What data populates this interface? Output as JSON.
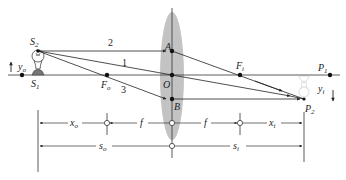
{
  "diagram": {
    "type": "thin-lens-ray-diagram",
    "object": {
      "top_label": "S",
      "top_sub": "2",
      "base_label": "S",
      "base_sub": "1",
      "height_label": "y",
      "height_sub": "o"
    },
    "image": {
      "top_label": "P",
      "top_sub": "1",
      "tip_label": "P",
      "tip_sub": "2",
      "height_label": "y",
      "height_sub": "i"
    },
    "lens": {
      "center_label": "O",
      "top_point_label": "A",
      "bottom_point_label": "B",
      "color": "#b8b8b8"
    },
    "focal_points": {
      "object_side_label": "F",
      "object_side_sub": "o",
      "image_side_label": "F",
      "image_side_sub": "i"
    },
    "rays": [
      {
        "id": "1",
        "label": "1",
        "path": "S2 → O → P2"
      },
      {
        "id": "2",
        "label": "2",
        "path": "S2 → A → Fi → P2"
      },
      {
        "id": "3",
        "label": "3",
        "path": "S2 → Fo → B → P2"
      }
    ],
    "dimensions": {
      "row1": [
        {
          "label": "x",
          "sub": "o"
        },
        {
          "label": "f",
          "sub": ""
        },
        {
          "label": "f",
          "sub": ""
        },
        {
          "label": "x",
          "sub": "i"
        }
      ],
      "row2": [
        {
          "label": "s",
          "sub": "o"
        },
        {
          "label": "s",
          "sub": "i"
        }
      ]
    }
  }
}
